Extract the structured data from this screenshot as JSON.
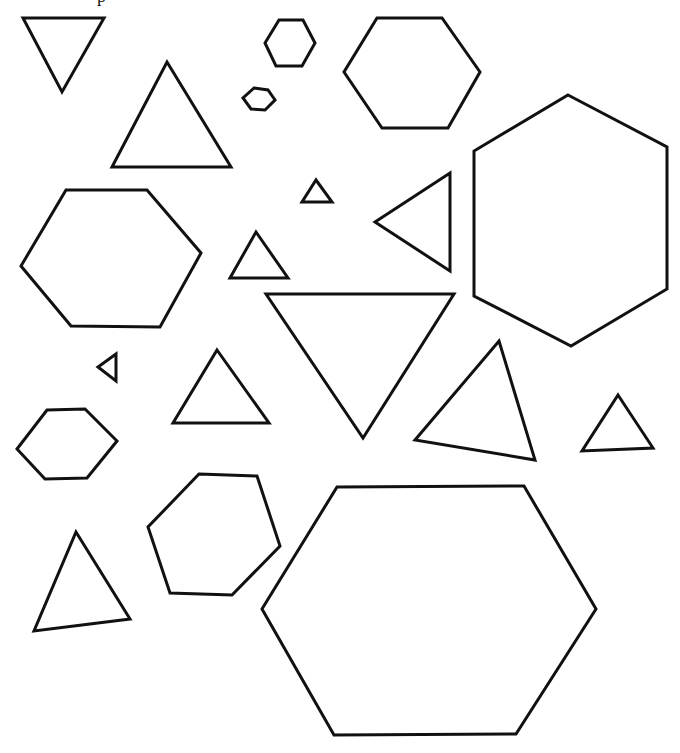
{
  "top_text_fragment": "p",
  "stroke_color": "#111111",
  "background_color": "#ffffff",
  "shapes": [
    {
      "kind": "triangle",
      "name": "triangle-inverted-top-left",
      "points": [
        [
          23,
          18
        ],
        [
          104,
          18
        ],
        [
          62,
          92
        ]
      ]
    },
    {
      "kind": "triangle",
      "name": "triangle-large-upper",
      "points": [
        [
          167,
          62
        ],
        [
          231,
          167
        ],
        [
          112,
          167
        ]
      ]
    },
    {
      "kind": "hexagon",
      "name": "hexagon-small-top",
      "points": [
        [
          279,
          20
        ],
        [
          303,
          20
        ],
        [
          315,
          43
        ],
        [
          302,
          66
        ],
        [
          276,
          66
        ],
        [
          265,
          43
        ]
      ]
    },
    {
      "kind": "hexagon",
      "name": "hexagon-tiny",
      "points": [
        [
          254,
          88
        ],
        [
          268,
          90
        ],
        [
          275,
          100
        ],
        [
          265,
          110
        ],
        [
          251,
          109
        ],
        [
          243,
          98
        ]
      ]
    },
    {
      "kind": "hexagon",
      "name": "hexagon-medium-top",
      "points": [
        [
          377,
          18
        ],
        [
          442,
          18
        ],
        [
          480,
          72
        ],
        [
          448,
          128
        ],
        [
          382,
          128
        ],
        [
          344,
          72
        ]
      ]
    },
    {
      "kind": "hexagon",
      "name": "hexagon-large-right",
      "points": [
        [
          568,
          95
        ],
        [
          667,
          147
        ],
        [
          667,
          289
        ],
        [
          571,
          346
        ],
        [
          474,
          296
        ],
        [
          474,
          151
        ]
      ]
    },
    {
      "kind": "hexagon",
      "name": "hexagon-left-middle",
      "points": [
        [
          66,
          190
        ],
        [
          147,
          190
        ],
        [
          201,
          253
        ],
        [
          160,
          327
        ],
        [
          71,
          326
        ],
        [
          21,
          266
        ]
      ]
    },
    {
      "kind": "triangle",
      "name": "triangle-tiny-center",
      "points": [
        [
          316,
          180
        ],
        [
          332,
          202
        ],
        [
          302,
          202
        ]
      ]
    },
    {
      "kind": "triangle",
      "name": "triangle-left-pointing",
      "points": [
        [
          450,
          173
        ],
        [
          450,
          271
        ],
        [
          375,
          222
        ]
      ]
    },
    {
      "kind": "triangle",
      "name": "triangle-small-center",
      "points": [
        [
          256,
          232
        ],
        [
          288,
          278
        ],
        [
          230,
          278
        ]
      ]
    },
    {
      "kind": "triangle",
      "name": "triangle-inverted-center",
      "points": [
        [
          266,
          294
        ],
        [
          454,
          294
        ],
        [
          363,
          438
        ]
      ]
    },
    {
      "kind": "triangle",
      "name": "triangle-tiny-left",
      "points": [
        [
          116,
          354
        ],
        [
          116,
          381
        ],
        [
          98,
          367
        ]
      ]
    },
    {
      "kind": "triangle",
      "name": "triangle-medium-left",
      "points": [
        [
          217,
          350
        ],
        [
          269,
          423
        ],
        [
          173,
          423
        ]
      ]
    },
    {
      "kind": "triangle",
      "name": "triangle-rotated-right",
      "points": [
        [
          499,
          341
        ],
        [
          535,
          460
        ],
        [
          415,
          440
        ]
      ]
    },
    {
      "kind": "triangle",
      "name": "triangle-small-right",
      "points": [
        [
          618,
          395
        ],
        [
          653,
          448
        ],
        [
          582,
          451
        ]
      ]
    },
    {
      "kind": "hexagon",
      "name": "hexagon-small-left",
      "points": [
        [
          47,
          410
        ],
        [
          85,
          409
        ],
        [
          117,
          441
        ],
        [
          87,
          478
        ],
        [
          45,
          479
        ],
        [
          17,
          449
        ]
      ]
    },
    {
      "kind": "hexagon",
      "name": "hexagon-rotated",
      "points": [
        [
          199,
          474
        ],
        [
          257,
          476
        ],
        [
          280,
          546
        ],
        [
          232,
          595
        ],
        [
          170,
          593
        ],
        [
          148,
          527
        ]
      ]
    },
    {
      "kind": "triangle",
      "name": "triangle-bottom-left",
      "points": [
        [
          76,
          532
        ],
        [
          130,
          619
        ],
        [
          34,
          631
        ]
      ]
    },
    {
      "kind": "hexagon",
      "name": "hexagon-large-bottom",
      "points": [
        [
          337,
          487
        ],
        [
          524,
          486
        ],
        [
          596,
          609
        ],
        [
          516,
          734
        ],
        [
          334,
          735
        ],
        [
          262,
          609
        ]
      ]
    }
  ]
}
